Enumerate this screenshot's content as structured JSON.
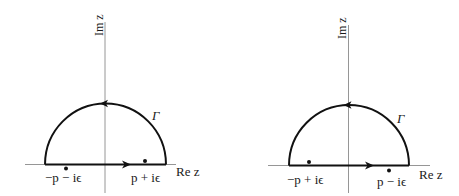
{
  "panels": [
    {
      "id": "left",
      "axis_labels": {
        "real": "Re z",
        "imag": "Im z"
      },
      "contour_label": "Γ",
      "poles": [
        {
          "label": "−p − iϵ",
          "position": "below-left"
        },
        {
          "label": "p + iϵ",
          "position": "above-right"
        }
      ]
    },
    {
      "id": "right",
      "axis_labels": {
        "real": "Re z",
        "imag": "Im z"
      },
      "contour_label": "Γ",
      "poles": [
        {
          "label": "−p + iϵ",
          "position": "above-left"
        },
        {
          "label": "p − iϵ",
          "position": "below-right"
        }
      ]
    }
  ],
  "colors": {
    "contour": "#111111",
    "axis": "#8a8a8a",
    "text": "#1a1a1a"
  }
}
